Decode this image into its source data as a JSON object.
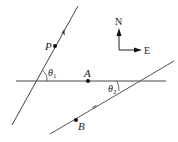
{
  "diagram": {
    "points": {
      "P": {
        "label": "P",
        "x": 55,
        "y": 46
      },
      "A": {
        "label": "A",
        "x": 88,
        "y": 81
      },
      "B": {
        "label": "B",
        "x": 76,
        "y": 120
      }
    },
    "angles": {
      "theta1": {
        "symbol": "θ",
        "subscript": "1"
      },
      "theta2": {
        "symbol": "θ",
        "subscript": "2"
      }
    },
    "compass": {
      "north_label": "N",
      "east_label": "E"
    },
    "colors": {
      "line": "#444444",
      "point": "#111111",
      "background": "#ffffff"
    }
  }
}
